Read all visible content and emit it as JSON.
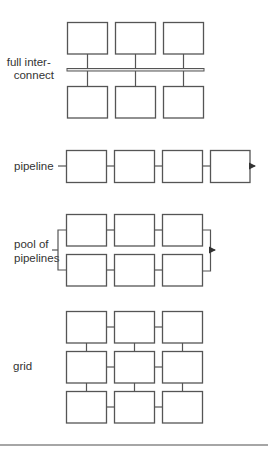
{
  "colors": {
    "stroke": "#555555",
    "box_fill": "#ffffff",
    "text": "#333333",
    "rule": "#888888"
  },
  "sections": [
    {
      "id": "full-interconnect",
      "label_lines": [
        "full inter-",
        "connect"
      ],
      "description": "2 rows of 3 processing elements connected via a shared bus"
    },
    {
      "id": "pipeline",
      "label_lines": [
        "pipeline"
      ],
      "description": "4 processing elements chained in series with input and output arrow"
    },
    {
      "id": "pool-of-pipelines",
      "label_lines": [
        "pool of",
        "pipelines"
      ],
      "description": "2 parallel pipelines of 3 elements each, fan-in/fan-out brackets and output arrow"
    },
    {
      "id": "grid",
      "label_lines": [
        "grid"
      ],
      "description": "3x3 mesh of processing elements with nearest-neighbor links"
    }
  ]
}
